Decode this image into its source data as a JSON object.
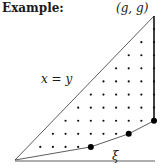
{
  "title": "Example:",
  "labels": {
    "corner": "(g, g)",
    "diagonal": "x = y",
    "path": "ξ"
  },
  "diagram": {
    "grid_size": 11,
    "path_vertices": [
      [
        0,
        0
      ],
      [
        6,
        1
      ],
      [
        9,
        2
      ],
      [
        11,
        3
      ],
      [
        11,
        11
      ]
    ],
    "marked_points": [
      [
        6,
        1
      ],
      [
        9,
        2
      ],
      [
        11,
        3
      ]
    ]
  }
}
